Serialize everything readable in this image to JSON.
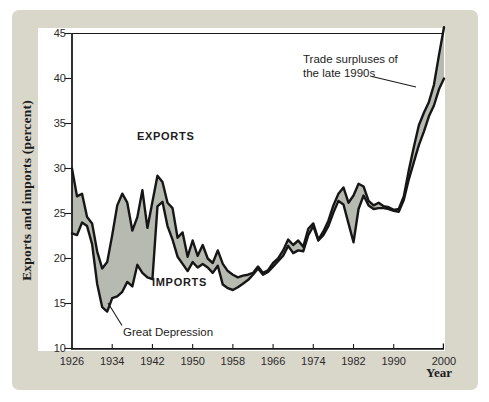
{
  "figure": {
    "y_axis_title": "Exports and imports (percent)",
    "x_axis_title": "Year",
    "series_labels": {
      "exports": "EXPORTS",
      "imports": "IMPORTS"
    },
    "annotations": {
      "great_depression": "Great Depression",
      "trade_surpluses_line1": "Trade surpluses of",
      "trade_surpluses_line2": "the late 1990s"
    },
    "colors": {
      "surround": "#d9d6ca",
      "panel": "#ffffff",
      "band_fill": "#b7bab1",
      "line": "#161616",
      "axis": "#1a1a1a",
      "text": "#1d1d1d"
    }
  },
  "chart_data": {
    "type": "area",
    "title": "",
    "xlabel": "Year",
    "ylabel": "Exports and imports (percent)",
    "xlim": [
      1926,
      2000
    ],
    "ylim": [
      10,
      45
    ],
    "x_ticks": [
      1926,
      1934,
      1942,
      1950,
      1958,
      1966,
      1974,
      1982,
      1990,
      2000
    ],
    "y_ticks": [
      45,
      40,
      35,
      30,
      25,
      20,
      15,
      10
    ],
    "grid": false,
    "legend": "in-plot text labels",
    "shading": "gray band fills the gap between the exports and imports curves",
    "annotations": [
      {
        "text": "Great Depression",
        "points_to_year": 1933,
        "points_to_series": "Imports"
      },
      {
        "text": "Trade surpluses of the late 1990s",
        "points_to_year": 1997,
        "points_to_series": "gap between Exports and Imports"
      }
    ],
    "x": [
      1926,
      1927,
      1928,
      1929,
      1930,
      1931,
      1932,
      1933,
      1934,
      1935,
      1936,
      1937,
      1938,
      1939,
      1940,
      1941,
      1942,
      1943,
      1944,
      1945,
      1946,
      1947,
      1948,
      1949,
      1950,
      1951,
      1952,
      1953,
      1954,
      1955,
      1956,
      1957,
      1958,
      1959,
      1960,
      1961,
      1962,
      1963,
      1964,
      1965,
      1966,
      1967,
      1968,
      1969,
      1970,
      1971,
      1972,
      1973,
      1974,
      1975,
      1976,
      1977,
      1978,
      1979,
      1980,
      1981,
      1982,
      1983,
      1984,
      1985,
      1986,
      1987,
      1988,
      1989,
      1990,
      1991,
      1992,
      1993,
      1994,
      1995,
      1996,
      1997,
      1998,
      1999,
      2000
    ],
    "series": [
      {
        "name": "Exports",
        "values": [
          30.0,
          26.9,
          27.2,
          24.6,
          23.9,
          20.8,
          18.9,
          19.6,
          22.6,
          25.9,
          27.2,
          26.2,
          23.1,
          24.6,
          27.6,
          23.4,
          26.3,
          29.2,
          28.5,
          26.2,
          25.6,
          22.3,
          22.9,
          20.2,
          22.0,
          20.3,
          21.5,
          20.0,
          19.5,
          20.9,
          19.4,
          18.6,
          18.2,
          17.9,
          18.1,
          18.2,
          18.4,
          19.1,
          18.4,
          18.7,
          19.5,
          20.0,
          20.9,
          22.1,
          21.5,
          22.0,
          21.3,
          23.3,
          23.9,
          22.1,
          23.0,
          24.2,
          25.9,
          27.2,
          27.9,
          26.2,
          27.0,
          28.3,
          28.0,
          26.4,
          25.9,
          26.2,
          25.8,
          25.7,
          25.4,
          25.5,
          26.9,
          29.8,
          32.4,
          34.8,
          36.2,
          37.4,
          39.3,
          42.6,
          45.7
        ]
      },
      {
        "name": "Imports",
        "values": [
          22.8,
          22.6,
          24.0,
          23.6,
          21.6,
          17.2,
          14.6,
          14.1,
          15.6,
          15.8,
          16.3,
          17.4,
          16.9,
          19.3,
          18.4,
          17.9,
          17.7,
          25.8,
          26.3,
          23.6,
          22.1,
          20.2,
          19.4,
          18.6,
          19.6,
          19.0,
          19.4,
          19.0,
          18.4,
          19.2,
          17.1,
          16.7,
          16.5,
          16.8,
          17.2,
          17.6,
          18.2,
          18.9,
          18.2,
          18.5,
          19.1,
          19.7,
          20.3,
          21.4,
          20.6,
          20.9,
          20.8,
          22.6,
          23.6,
          22.0,
          22.6,
          23.6,
          25.1,
          26.4,
          26.0,
          23.9,
          21.8,
          25.5,
          27.0,
          25.9,
          25.5,
          25.6,
          25.6,
          25.5,
          25.3,
          25.2,
          26.5,
          28.8,
          30.7,
          32.6,
          34.1,
          35.8,
          37.0,
          38.8,
          40.0
        ]
      }
    ]
  }
}
